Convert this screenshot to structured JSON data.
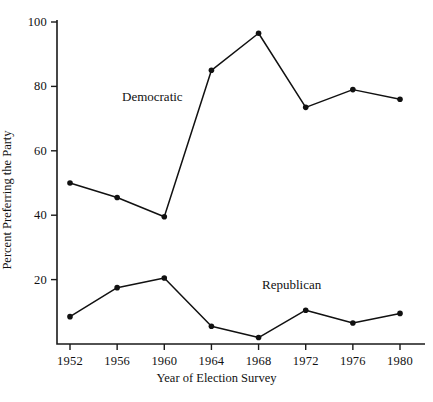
{
  "chart_data": {
    "type": "line",
    "title": "",
    "xlabel": "Year of Election Survey",
    "ylabel": "Percent Preferring the Party",
    "categories": [
      "1952",
      "1956",
      "1960",
      "1964",
      "1968",
      "1972",
      "1976",
      "1980"
    ],
    "x": [
      1952,
      1956,
      1960,
      1964,
      1968,
      1972,
      1976,
      1980
    ],
    "xlim": [
      1952,
      1980
    ],
    "ylim": [
      0,
      100
    ],
    "yticks": [
      20,
      40,
      60,
      80,
      100
    ],
    "ytick_labels": [
      "20",
      "40",
      "60",
      "80",
      "100"
    ],
    "xticks": [
      1952,
      1956,
      1960,
      1964,
      1968,
      1972,
      1976,
      1980
    ],
    "grid": false,
    "legend_position": "inline-annotations",
    "marker": "filled-circle",
    "line_color": "#111111",
    "series": [
      {
        "name": "Democratic",
        "values": [
          50,
          45.5,
          39.5,
          85,
          96.5,
          73.5,
          79,
          76
        ]
      },
      {
        "name": "Republican",
        "values": [
          8.5,
          17.5,
          20.5,
          5.5,
          2,
          10.5,
          6.5,
          9.5
        ]
      }
    ],
    "annotations": [
      {
        "text": "Democratic",
        "series": "Democratic"
      },
      {
        "text": "Republican",
        "series": "Republican"
      }
    ]
  },
  "axes": {
    "y_tick_labels": [
      "100",
      "80",
      "60",
      "40",
      "20"
    ],
    "x_tick_labels": [
      "1952",
      "1956",
      "1960",
      "1964",
      "1968",
      "1972",
      "1976",
      "1980"
    ],
    "x_title": "Year of Election Survey",
    "y_title": "Percent Preferring the Party"
  },
  "labels": {
    "democratic": "Democratic",
    "republican": "Republican"
  }
}
